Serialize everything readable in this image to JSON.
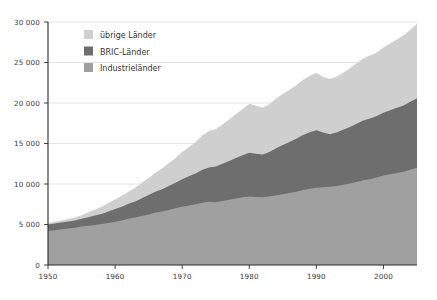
{
  "chart_data": {
    "type": "area",
    "title": "",
    "subtitle": "",
    "xlabel": "",
    "ylabel": "",
    "stacked": true,
    "grid": true,
    "legend_position": "top-left-inside",
    "xlim": [
      1950,
      2005
    ],
    "ylim": [
      0,
      30000
    ],
    "xticks": [
      1950,
      1960,
      1970,
      1980,
      1990,
      2000
    ],
    "xtick_labels": [
      "1950",
      "1960",
      "1970",
      "1980",
      "1990",
      "2000"
    ],
    "yticks": [
      0,
      5000,
      10000,
      15000,
      20000,
      25000,
      30000
    ],
    "ytick_labels": [
      "0",
      "5 000",
      "10 000",
      "15 000",
      "20 000",
      "25 000",
      "30 000"
    ],
    "x": [
      1950,
      1951,
      1952,
      1953,
      1954,
      1955,
      1956,
      1957,
      1958,
      1959,
      1960,
      1961,
      1962,
      1963,
      1964,
      1965,
      1966,
      1967,
      1968,
      1969,
      1970,
      1971,
      1972,
      1973,
      1974,
      1975,
      1976,
      1977,
      1978,
      1979,
      1980,
      1981,
      1982,
      1983,
      1984,
      1985,
      1986,
      1987,
      1988,
      1989,
      1990,
      1991,
      1992,
      1993,
      1994,
      1995,
      1996,
      1997,
      1998,
      1999,
      2000,
      2001,
      2002,
      2003,
      2004,
      2005
    ],
    "series": [
      {
        "name": "Industrieländer",
        "color": "#a0a0a0",
        "stack_order": 1,
        "values": [
          4200,
          4300,
          4400,
          4500,
          4600,
          4750,
          4850,
          4950,
          5050,
          5200,
          5350,
          5500,
          5700,
          5850,
          6050,
          6250,
          6450,
          6600,
          6800,
          7000,
          7200,
          7350,
          7500,
          7700,
          7800,
          7750,
          7900,
          8050,
          8200,
          8350,
          8450,
          8400,
          8350,
          8450,
          8600,
          8750,
          8900,
          9050,
          9250,
          9400,
          9550,
          9600,
          9650,
          9750,
          9900,
          10050,
          10250,
          10450,
          10600,
          10800,
          11050,
          11200,
          11350,
          11500,
          11750,
          12000
        ]
      },
      {
        "name": "BRIC-Länder",
        "color": "#6e6e6e",
        "stack_order": 2,
        "values": [
          800,
          820,
          840,
          870,
          900,
          950,
          1050,
          1150,
          1250,
          1400,
          1550,
          1700,
          1850,
          2000,
          2200,
          2400,
          2600,
          2750,
          2950,
          3150,
          3400,
          3600,
          3800,
          4050,
          4250,
          4400,
          4600,
          4800,
          5000,
          5200,
          5400,
          5350,
          5300,
          5500,
          5800,
          6050,
          6300,
          6550,
          6800,
          7000,
          7100,
          6750,
          6500,
          6600,
          6800,
          7000,
          7200,
          7400,
          7500,
          7600,
          7750,
          7900,
          8050,
          8200,
          8400,
          8600
        ]
      },
      {
        "name": "übrige Länder",
        "color": "#cfcfcf",
        "stack_order": 3,
        "values": [
          200,
          230,
          260,
          300,
          350,
          450,
          600,
          750,
          900,
          1050,
          1200,
          1350,
          1500,
          1700,
          1900,
          2100,
          2350,
          2550,
          2800,
          3050,
          3350,
          3600,
          3900,
          4250,
          4500,
          4600,
          4850,
          5100,
          5400,
          5700,
          6050,
          5900,
          5750,
          5900,
          6150,
          6300,
          6450,
          6600,
          6800,
          6950,
          7050,
          6900,
          6800,
          6900,
          7050,
          7250,
          7450,
          7650,
          7750,
          7850,
          8050,
          8250,
          8450,
          8650,
          8900,
          9150
        ]
      }
    ],
    "legend": [
      {
        "label": "übrige Länder",
        "color": "#cfcfcf"
      },
      {
        "label": "BRIC-Länder",
        "color": "#6e6e6e"
      },
      {
        "label": "Industrieländer",
        "color": "#a0a0a0"
      }
    ]
  }
}
